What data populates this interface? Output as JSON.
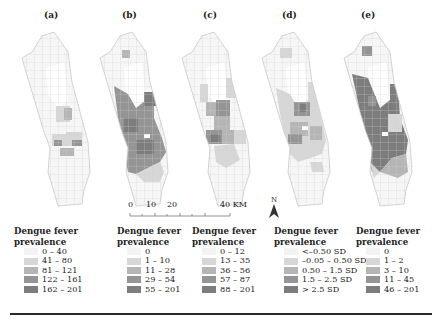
{
  "figure": {
    "panels": [
      {
        "id": "a",
        "label": "(a)"
      },
      {
        "id": "b",
        "label": "(b)"
      },
      {
        "id": "c",
        "label": "(c)"
      },
      {
        "id": "d",
        "label": "(d)"
      },
      {
        "id": "e",
        "label": "(e)"
      }
    ],
    "scale_bar": {
      "ticks": [
        "0",
        "10",
        "20",
        "40 KM"
      ]
    },
    "north_arrow": {
      "label": "N"
    },
    "colors": {
      "class1": "#f3f3f3",
      "class2": "#d7d7d7",
      "class3": "#b5b5b5",
      "class4": "#959595",
      "class5": "#7d7d7d",
      "boundary": "#c9c9c9",
      "rule": "#2a2a2a"
    },
    "legends": [
      {
        "title_line1": "Dengue fever",
        "title_line2": "prevalence",
        "items": [
          "0 – 40",
          "41 – 80",
          "81 – 121",
          "122 – 161",
          "162 – 201"
        ]
      },
      {
        "title_line1": "Dengue fever",
        "title_line2": "prevalence",
        "items": [
          "0",
          "1 – 10",
          "11 – 28",
          "29 – 54",
          "55 – 201"
        ]
      },
      {
        "title_line1": "Dengue fever",
        "title_line2": "prevalence",
        "items": [
          "0 – 12",
          "13 – 35",
          "36 – 56",
          "57 – 87",
          "88 – 201"
        ]
      },
      {
        "title_line1": "Dengue fever",
        "title_line2": "prevalence",
        "items": [
          "<–0.50 SD",
          "–0.05 – 0.50 SD",
          "0.50 – 1.5 SD",
          "1.5 – 2.5 SD",
          "> 2.5 SD"
        ]
      },
      {
        "title_line1": "Dengue fever",
        "title_line2": "prevalence",
        "items": [
          "0",
          "1 – 2",
          "3 – 10",
          "11 – 45",
          "46 – 201"
        ]
      }
    ]
  }
}
